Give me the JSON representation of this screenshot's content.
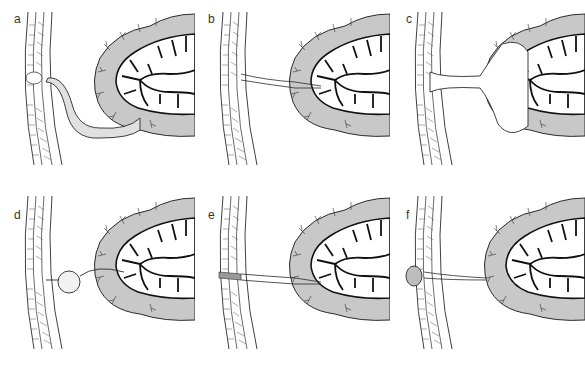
{
  "figure": {
    "colors": {
      "mesentery_fill": "#c8c8c8",
      "outline": "#2a2a2a",
      "vessel": "#111111",
      "background": "#ffffff"
    },
    "panels": [
      {
        "label": "a",
        "variant": "patent-duct"
      },
      {
        "label": "b",
        "variant": "fibrous-cord"
      },
      {
        "label": "c",
        "variant": "wide-fistula"
      },
      {
        "label": "d",
        "variant": "cyst"
      },
      {
        "label": "e",
        "variant": "umbilical-sinus"
      },
      {
        "label": "f",
        "variant": "umbilical-polyp"
      }
    ]
  }
}
